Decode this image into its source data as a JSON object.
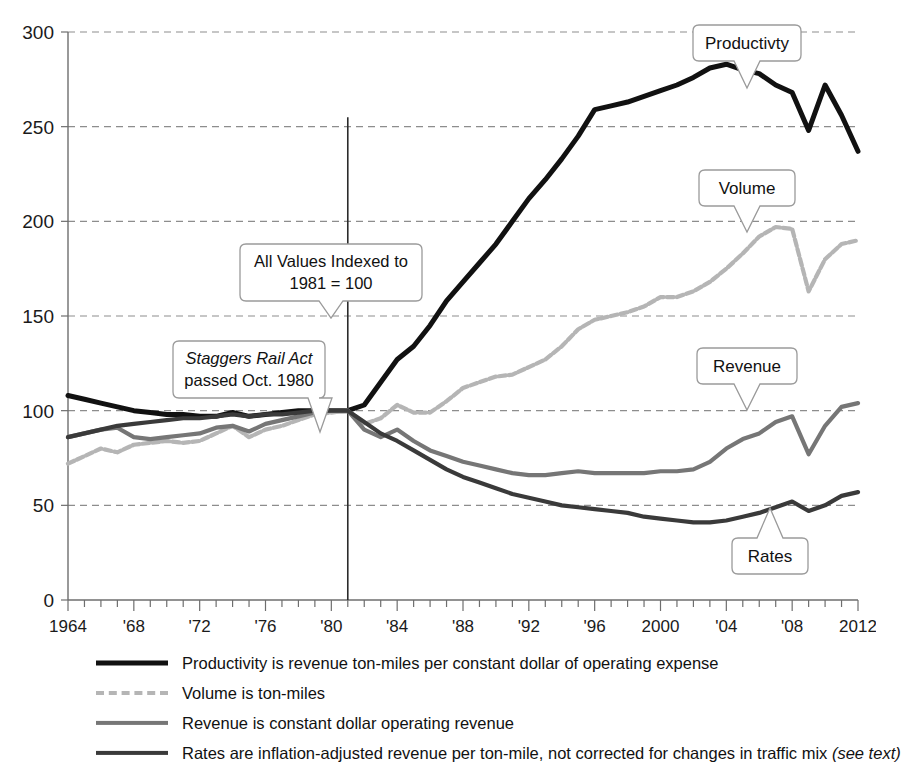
{
  "chart_data": {
    "type": "line",
    "title": "",
    "xlabel": "",
    "ylabel": "",
    "xlim": [
      1964,
      2012
    ],
    "ylim": [
      0,
      300
    ],
    "yticks": [
      0,
      50,
      100,
      150,
      200,
      250,
      300
    ],
    "ytick_labels": [
      "0",
      "50",
      "100",
      "150",
      "200",
      "250",
      "300"
    ],
    "xticks": [
      1964,
      1968,
      1972,
      1976,
      1980,
      1984,
      1988,
      1992,
      1996,
      2000,
      2004,
      2008,
      2012
    ],
    "xtick_labels": [
      "1964",
      "'68",
      "'72",
      "'76",
      "'80",
      "'84",
      "'88",
      "'92",
      "'96",
      "2000",
      "'04",
      "'08",
      "2012"
    ],
    "grid": "horizontal-dashed",
    "legend_position": "below",
    "x": [
      1964,
      1965,
      1966,
      1967,
      1968,
      1969,
      1970,
      1971,
      1972,
      1973,
      1974,
      1975,
      1976,
      1977,
      1978,
      1979,
      1980,
      1981,
      1982,
      1983,
      1984,
      1985,
      1986,
      1987,
      1988,
      1989,
      1990,
      1991,
      1992,
      1993,
      1994,
      1995,
      1996,
      1997,
      1998,
      1999,
      2000,
      2001,
      2002,
      2003,
      2004,
      2005,
      2006,
      2007,
      2008,
      2009,
      2010,
      2011,
      2012
    ],
    "series": [
      {
        "name": "Productivity",
        "color": "#111111",
        "style": "solid-thick",
        "values": [
          108,
          106,
          104,
          102,
          100,
          99,
          98,
          98,
          97,
          97,
          99,
          97,
          98,
          99,
          100,
          100,
          100,
          100,
          103,
          115,
          127,
          134,
          145,
          158,
          168,
          178,
          188,
          200,
          212,
          222,
          233,
          245,
          259,
          261,
          263,
          266,
          269,
          272,
          276,
          281,
          283,
          280,
          278,
          272,
          268,
          248,
          272,
          256,
          237
        ]
      },
      {
        "name": "Volume",
        "color": "#b5b5b5",
        "style": "dashed-light",
        "values": [
          72,
          76,
          80,
          78,
          82,
          83,
          84,
          83,
          84,
          88,
          92,
          86,
          90,
          92,
          95,
          98,
          99,
          100,
          93,
          96,
          103,
          99,
          99,
          105,
          112,
          115,
          118,
          119,
          123,
          127,
          134,
          143,
          148,
          150,
          152,
          155,
          160,
          160,
          163,
          168,
          175,
          183,
          192,
          197,
          196,
          163,
          180,
          188,
          190
        ]
      },
      {
        "name": "Revenue",
        "color": "#767676",
        "style": "solid-medium",
        "values": [
          86,
          88,
          90,
          91,
          86,
          85,
          86,
          87,
          88,
          91,
          92,
          89,
          93,
          95,
          97,
          99,
          100,
          100,
          90,
          86,
          90,
          84,
          79,
          76,
          73,
          71,
          69,
          67,
          66,
          66,
          67,
          68,
          67,
          67,
          67,
          67,
          68,
          68,
          69,
          73,
          80,
          85,
          88,
          94,
          97,
          77,
          92,
          102,
          104
        ]
      },
      {
        "name": "Rates",
        "color": "#3a3a3a",
        "style": "solid-dark",
        "values": [
          86,
          88,
          90,
          92,
          93,
          94,
          95,
          96,
          96,
          97,
          98,
          97,
          98,
          98,
          99,
          100,
          100,
          100,
          94,
          88,
          84,
          79,
          74,
          69,
          65,
          62,
          59,
          56,
          54,
          52,
          50,
          49,
          48,
          47,
          46,
          44,
          43,
          42,
          41,
          41,
          42,
          44,
          46,
          49,
          52,
          47,
          50,
          55,
          57
        ]
      }
    ],
    "markers": [
      {
        "name": "index-line",
        "x": 1981,
        "label": "1981 index line"
      }
    ]
  },
  "annotations": {
    "indexed_note": {
      "line1": "All Values Indexed to",
      "line2": "1981 = 100"
    },
    "staggers_note": {
      "line1": "Staggers Rail Act",
      "line2": "passed Oct. 1980"
    }
  },
  "pointer_labels": {
    "productivity": "Productivty",
    "volume": "Volume",
    "revenue": "Revenue",
    "rates": "Rates"
  },
  "legend": {
    "items": [
      {
        "key": "productivity",
        "label": "Productivity is revenue ton-miles per constant dollar of operating expense",
        "color": "#111111",
        "style": "solid-thick"
      },
      {
        "key": "volume",
        "label": "Volume is ton-miles",
        "color": "#b5b5b5",
        "style": "dashed-light"
      },
      {
        "key": "revenue",
        "label": "Revenue is constant dollar operating revenue",
        "color": "#767676",
        "style": "solid-medium"
      },
      {
        "key": "rates",
        "label": "Rates are inflation-adjusted revenue per ton-mile, not corrected for changes in traffic mix ",
        "suffix": "(see text)",
        "color": "#3a3a3a",
        "style": "solid-dark"
      }
    ]
  }
}
